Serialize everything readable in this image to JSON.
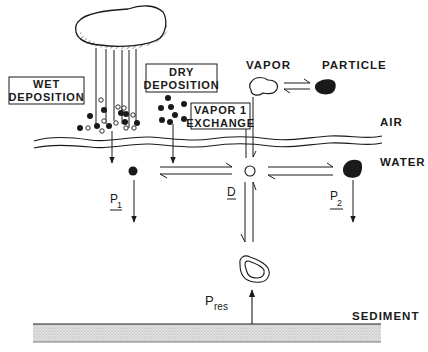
{
  "diagram": {
    "regions": {
      "air": "AIR",
      "water": "WATER",
      "sediment": "SEDIMENT"
    },
    "boxes": {
      "wet_deposition": [
        "WET",
        "DEPOSITION"
      ],
      "dry_deposition": [
        "DRY",
        "DEPOSITION"
      ],
      "vapor_exchange": [
        "VAPOR 1",
        "EXCHANGE"
      ]
    },
    "phase_labels": {
      "vapor": "VAPOR",
      "particle": "PARTICLE"
    },
    "symbols": {
      "p1": "P",
      "p1_sub": "1",
      "p2": "P",
      "p2_sub": "2",
      "d": "D",
      "pres": "P",
      "pres_sub": "res"
    },
    "colors": {
      "ink": "#1a1a1a",
      "sediment_fill": "#d8d8d8",
      "background": "#ffffff"
    }
  }
}
